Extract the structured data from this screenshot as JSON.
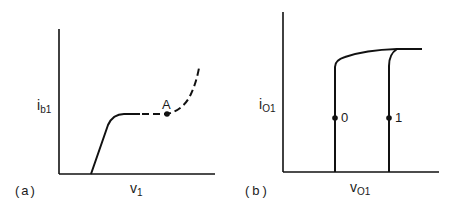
{
  "panels": [
    {
      "id": "a",
      "caption": "(a)",
      "y_label": {
        "main": "i",
        "sub": "b1"
      },
      "x_label": {
        "main": "v",
        "sub": "1"
      },
      "point_label": "A",
      "description": "Base current vs input voltage; solid rise to plateau, dashed continuation through point A then rising steeply"
    },
    {
      "id": "b",
      "caption": "(b)",
      "y_label": {
        "main": "i",
        "sub": "O1"
      },
      "x_label": {
        "main": "v",
        "sub": "O1"
      },
      "point_labels": [
        "0",
        "1"
      ],
      "description": "Output current vs output voltage; two near-vertical curves labeled 0 and 1 merging into a common saturating top line"
    }
  ],
  "colors": {
    "line": "#111111",
    "background": "#ffffff"
  }
}
